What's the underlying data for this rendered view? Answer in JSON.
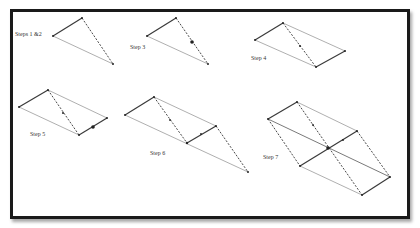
{
  "figure": {
    "colors": {
      "frame": "#1a1a1a",
      "solid_edge": "#3a3a3a",
      "dashed_edge": "#4a4a4a",
      "light_edge": "#9a9a9a",
      "vertex": "#222222"
    },
    "steps": [
      {
        "label": "Steps 1 &2",
        "label_pos": [
          15,
          34
        ]
      },
      {
        "label": "Step 3",
        "label_pos": [
          130,
          47
        ]
      },
      {
        "label": "Step 4",
        "label_pos": [
          251,
          58
        ]
      },
      {
        "label": "Step 5",
        "label_pos": [
          30,
          134
        ]
      },
      {
        "label": "Step 6",
        "label_pos": [
          150,
          153
        ]
      },
      {
        "label": "Step 7",
        "label_pos": [
          263,
          157
        ]
      }
    ]
  }
}
